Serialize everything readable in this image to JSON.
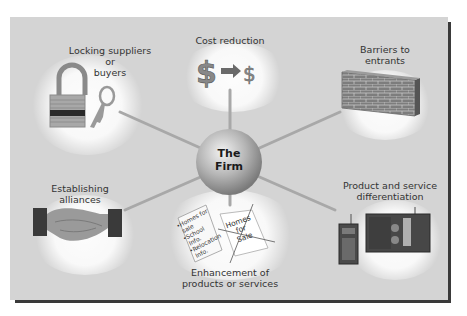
{
  "center": {
    "line1": "The",
    "line2": "Firm"
  },
  "nodes": [
    {
      "id": "locking",
      "lines": [
        "Locking suppliers",
        "or",
        "buyers"
      ],
      "icon": "padlock-and-key-icon"
    },
    {
      "id": "cost",
      "lines": [
        "Cost reduction"
      ],
      "icon": "dollar-to-dollar-icon",
      "big_symbol": "$",
      "small_symbol": "$"
    },
    {
      "id": "barriers",
      "lines": [
        "Barriers to",
        "entrants"
      ],
      "icon": "brick-wall-icon"
    },
    {
      "id": "alliances",
      "lines": [
        "Establishing",
        "alliances"
      ],
      "icon": "handshake-icon"
    },
    {
      "id": "enhancement",
      "lines": [
        "Enhancement of",
        "products or services"
      ],
      "icon": "documents-icon",
      "doc_left_lines": [
        "•Homes for",
        "sale",
        "•School",
        "Info.",
        "•Relocation",
        "Info."
      ],
      "doc_right_lines": [
        "Homes",
        "for",
        "Sale"
      ]
    },
    {
      "id": "differentiation",
      "lines": [
        "Product and service",
        "differentiation"
      ],
      "icon": "radios-icon"
    }
  ],
  "colors": {
    "panel": "#d4d4d4",
    "border": "#3a3a3a",
    "spoke": "#a8a8a8",
    "text": "#333333"
  }
}
